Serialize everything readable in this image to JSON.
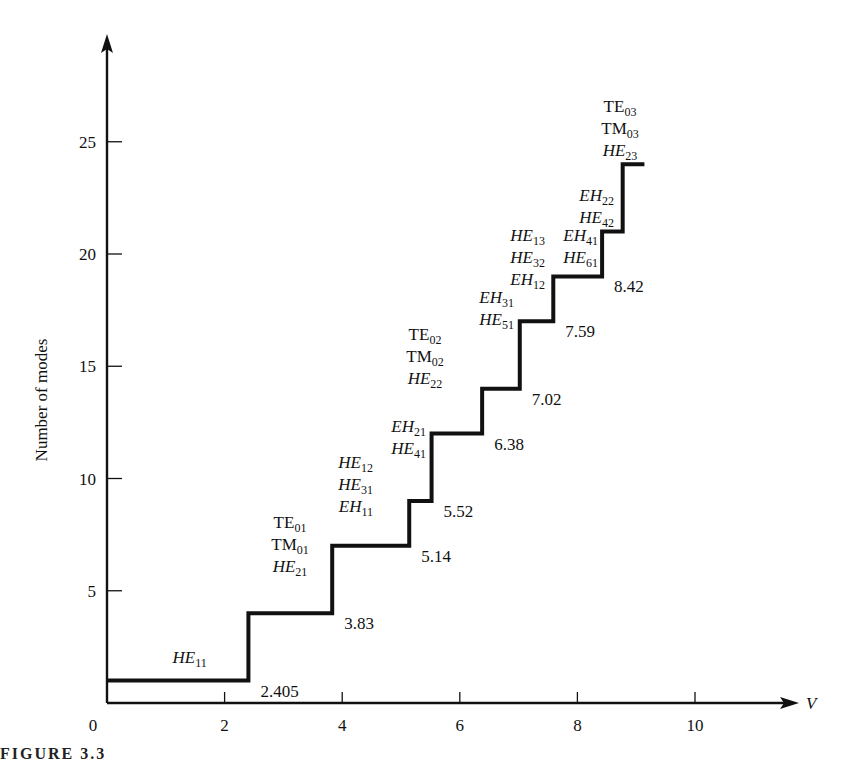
{
  "chart_data": {
    "type": "line",
    "subtype": "step",
    "title": "",
    "xlabel": "V",
    "ylabel": "Number of modes",
    "xlim": [
      0,
      11.8
    ],
    "ylim": [
      0,
      28
    ],
    "x_ticks": [
      0,
      2,
      4,
      6,
      8,
      10
    ],
    "y_ticks": [
      5,
      10,
      15,
      20,
      25
    ],
    "grid": false,
    "legend": null,
    "steps": [
      {
        "from": 0,
        "to": 2.405,
        "modes": 1,
        "cutoff_label": "2.405",
        "new_modes": [
          "HE11"
        ]
      },
      {
        "from": 2.405,
        "to": 3.83,
        "modes": 4,
        "cutoff_label": "3.83",
        "new_modes": [
          "TE01",
          "TM01",
          "HE21"
        ]
      },
      {
        "from": 3.83,
        "to": 5.14,
        "modes": 7,
        "cutoff_label": "5.14",
        "new_modes": [
          "HE12",
          "HE31",
          "EH11"
        ]
      },
      {
        "from": 5.14,
        "to": 5.52,
        "modes": 9,
        "cutoff_label": "5.52",
        "new_modes": [
          "EH21",
          "HE41"
        ]
      },
      {
        "from": 5.52,
        "to": 6.38,
        "modes": 12,
        "cutoff_label": "6.38",
        "new_modes": [
          "TE02",
          "TM02",
          "HE22"
        ]
      },
      {
        "from": 6.38,
        "to": 7.02,
        "modes": 14,
        "cutoff_label": "7.02",
        "new_modes": [
          "EH31",
          "HE51"
        ]
      },
      {
        "from": 7.02,
        "to": 7.59,
        "modes": 17,
        "cutoff_label": "7.59",
        "new_modes": [
          "HE13",
          "HE32",
          "EH12"
        ]
      },
      {
        "from": 7.59,
        "to": 8.42,
        "modes": 19,
        "cutoff_label": "8.42",
        "new_modes": [
          "EH41",
          "HE61"
        ]
      },
      {
        "from": 8.42,
        "to": 8.77,
        "modes": 21,
        "cutoff_label": null,
        "new_modes": [
          "EH22",
          "HE42"
        ]
      },
      {
        "from": 8.77,
        "to": 9.14,
        "modes": 24,
        "cutoff_label": null,
        "new_modes": [
          "TE03",
          "TM03",
          "HE23"
        ]
      }
    ]
  },
  "axes": {
    "x_label": "V",
    "y_label": "Number of modes",
    "x_tick_labels": [
      "0",
      "2",
      "4",
      "6",
      "8",
      "10"
    ],
    "y_tick_labels": [
      "5",
      "10",
      "15",
      "20",
      "25"
    ]
  },
  "caption": "FIGURE 3.3"
}
